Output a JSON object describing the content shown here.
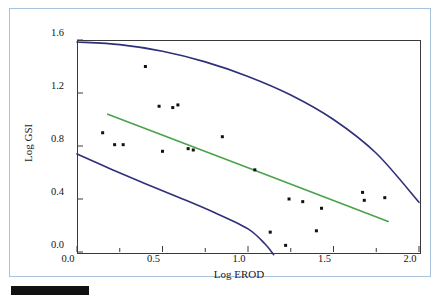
{
  "figure": {
    "background_color": "#ffffff",
    "panel_border_color": "#a9c3dd",
    "plot_frame_color": "#3a3a3a",
    "caption_bar_color": "#111111"
  },
  "axis": {
    "x_title": "Log EROD",
    "y_title": "Log GSI",
    "x_ticks": [
      "0.0",
      "0.5",
      "1.0",
      "1.5",
      "2.0"
    ],
    "y_ticks": [
      "0.0",
      "0.4",
      "0.8",
      "1.2",
      "1.6"
    ]
  },
  "chart_data": {
    "type": "scatter",
    "title": "",
    "xlabel": "Log EROD",
    "ylabel": "Log GSI",
    "xlim": [
      0.0,
      2.0
    ],
    "ylim": [
      0.0,
      1.6
    ],
    "x_ticks": [
      0.0,
      0.5,
      1.0,
      1.5,
      2.0
    ],
    "y_ticks": [
      0.0,
      0.4,
      0.8,
      1.2,
      1.6
    ],
    "x_minor_ticks": [
      0.25,
      0.75,
      1.25,
      1.75
    ],
    "grid": false,
    "legend": false,
    "marker_color": "#111111",
    "marker_shape": "square",
    "marker_size_px": 3,
    "points": [
      {
        "x": 0.15,
        "y": 0.9
      },
      {
        "x": 0.22,
        "y": 0.81
      },
      {
        "x": 0.27,
        "y": 0.81
      },
      {
        "x": 0.4,
        "y": 1.4
      },
      {
        "x": 0.48,
        "y": 1.1
      },
      {
        "x": 0.56,
        "y": 1.09
      },
      {
        "x": 0.59,
        "y": 1.11
      },
      {
        "x": 0.5,
        "y": 0.76
      },
      {
        "x": 0.65,
        "y": 0.78
      },
      {
        "x": 0.68,
        "y": 0.77
      },
      {
        "x": 0.85,
        "y": 0.87
      },
      {
        "x": 1.04,
        "y": 0.62
      },
      {
        "x": 1.13,
        "y": 0.15
      },
      {
        "x": 1.22,
        "y": 0.05
      },
      {
        "x": 1.24,
        "y": 0.4
      },
      {
        "x": 1.32,
        "y": 0.38
      },
      {
        "x": 1.4,
        "y": 0.16
      },
      {
        "x": 1.43,
        "y": 0.33
      },
      {
        "x": 1.67,
        "y": 0.45
      },
      {
        "x": 1.68,
        "y": 0.39
      },
      {
        "x": 1.8,
        "y": 0.41
      }
    ],
    "series": [
      {
        "name": "regression-line",
        "type": "line",
        "color": "#4aa24a",
        "points": [
          {
            "x": 0.18,
            "y": 1.04
          },
          {
            "x": 1.82,
            "y": 0.23
          }
        ]
      },
      {
        "name": "upper-confidence-band",
        "type": "curve",
        "color": "#2f2f7a",
        "points": [
          {
            "x": 0.0,
            "y": 1.585
          },
          {
            "x": 0.25,
            "y": 1.565
          },
          {
            "x": 0.5,
            "y": 1.515
          },
          {
            "x": 0.75,
            "y": 1.435
          },
          {
            "x": 1.0,
            "y": 1.325
          },
          {
            "x": 1.25,
            "y": 1.185
          },
          {
            "x": 1.5,
            "y": 1.0
          },
          {
            "x": 1.75,
            "y": 0.745
          },
          {
            "x": 2.0,
            "y": 0.375
          }
        ]
      },
      {
        "name": "lower-confidence-band",
        "type": "curve",
        "color": "#2f2f7a",
        "points": [
          {
            "x": 0.0,
            "y": 0.74
          },
          {
            "x": 0.2,
            "y": 0.625
          },
          {
            "x": 0.4,
            "y": 0.515
          },
          {
            "x": 0.6,
            "y": 0.41
          },
          {
            "x": 0.8,
            "y": 0.3
          },
          {
            "x": 1.0,
            "y": 0.175
          },
          {
            "x": 1.1,
            "y": 0.06
          },
          {
            "x": 1.15,
            "y": -0.02
          }
        ]
      }
    ]
  }
}
